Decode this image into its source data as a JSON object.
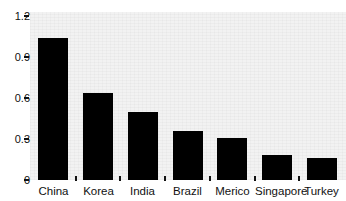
{
  "chart_data": {
    "type": "bar",
    "title": "",
    "xlabel": "",
    "ylabel": "",
    "categories": [
      "China",
      "Korea",
      "India",
      "Brazil",
      "Merico",
      "Singapore",
      "Turkey"
    ],
    "values": [
      1.04,
      0.64,
      0.5,
      0.36,
      0.31,
      0.18,
      0.16
    ],
    "ylim": [
      0,
      1.2
    ],
    "yticks": [
      "0",
      "0.3",
      "0.6",
      "0.9",
      "1.2"
    ],
    "ytick_values": [
      0,
      0.3,
      0.6,
      0.9,
      1.2
    ],
    "grid": false,
    "legend": false,
    "bar_color": "#000000",
    "plot_background": "#f2f2f2"
  },
  "axes": {
    "y": {
      "ticks": [
        {
          "label": "1.2",
          "value": 1.2
        },
        {
          "label": "0.9",
          "value": 0.9
        },
        {
          "label": "0.6",
          "value": 0.6
        },
        {
          "label": "0.3",
          "value": 0.3
        },
        {
          "label": "0",
          "value": 0
        }
      ]
    },
    "x": {
      "ticks": [
        {
          "label": "China"
        },
        {
          "label": "Korea"
        },
        {
          "label": "India"
        },
        {
          "label": "Brazil"
        },
        {
          "label": "Merico"
        },
        {
          "label": "Singapore"
        },
        {
          "label": "Turkey"
        }
      ]
    }
  }
}
